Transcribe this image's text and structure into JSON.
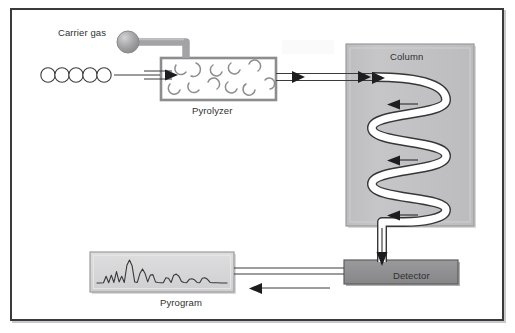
{
  "diagram": {
    "labels": {
      "carrier_gas": "Carrier gas",
      "pyrolyzer": "Pyrolyzer",
      "column": "Column",
      "detector": "Detector",
      "pyrogram": "Pyrogram"
    },
    "colors": {
      "frame_border": "#3a3a3c",
      "background": "#ffffff",
      "column_fill": "#c2c2c4",
      "column_border": "#8e8e90",
      "detector_fill": "#8f8f91",
      "detector_border": "#5c5c5e",
      "pyrolyzer_border": "#8a8a8c",
      "pyrogram_fill": "#d6d6d8",
      "pyrogram_border": "#9a9a9c",
      "tube_fill": "#ffffff",
      "tube_stroke": "#3a3a3c",
      "gas_sphere": "#9e9ea0",
      "line": "#3a3a3c"
    },
    "components": {
      "carrier_gas_sphere": {
        "cx": 128,
        "cy": 42,
        "r": 11
      },
      "sample_chain": {
        "description": "polymer chain of five linked circles",
        "count": 5,
        "radius": 7,
        "cy": 75,
        "start_cx": 48,
        "spacing": 14
      },
      "pyrolyzer_box": {
        "x": 161,
        "y": 58,
        "w": 115,
        "h": 42
      },
      "pyrolyzer_fragments": {
        "description": "broken polymer arc fragments inside pyrolyzer",
        "count": 11
      },
      "column_box": {
        "x": 346,
        "y": 44,
        "w": 128,
        "h": 182
      },
      "column_coil_turns": 4,
      "detector_box": {
        "x": 344,
        "y": 260,
        "w": 114,
        "h": 24
      },
      "pyrogram_box": {
        "x": 90,
        "y": 252,
        "w": 144,
        "h": 40
      }
    },
    "flow": [
      {
        "from": "sample_chain",
        "to": "pyrolyzer",
        "direction": "right"
      },
      {
        "from": "carrier_gas",
        "to": "pyrolyzer",
        "direction": "down"
      },
      {
        "from": "pyrolyzer",
        "to": "column",
        "direction": "right"
      },
      {
        "from": "column",
        "to": "detector",
        "direction": "down"
      },
      {
        "from": "detector",
        "to": "pyrogram",
        "direction": "left"
      }
    ]
  },
  "chart_data": {
    "type": "line",
    "title": "Pyrogram",
    "xlabel": "",
    "ylabel": "",
    "grid": false,
    "legend_position": "none",
    "x": [
      0,
      2,
      5,
      7,
      9,
      11,
      13,
      15,
      17,
      19,
      21,
      23,
      25,
      27,
      29,
      31,
      33,
      35,
      37,
      39,
      41,
      43,
      45,
      47,
      49,
      51,
      53,
      55,
      57,
      59,
      61,
      63,
      65,
      67,
      69,
      71,
      73,
      75,
      77,
      79,
      81,
      83,
      85,
      87,
      89,
      92,
      96,
      100
    ],
    "values": [
      4,
      4,
      5,
      30,
      5,
      34,
      6,
      48,
      8,
      30,
      6,
      72,
      92,
      70,
      8,
      6,
      40,
      58,
      40,
      8,
      34,
      36,
      8,
      6,
      5,
      5,
      24,
      22,
      6,
      34,
      38,
      30,
      10,
      6,
      5,
      18,
      20,
      16,
      6,
      5,
      22,
      24,
      18,
      6,
      5,
      5,
      4,
      4
    ],
    "ylim": [
      0,
      100
    ],
    "xlim": [
      0,
      100
    ],
    "peaks": [
      {
        "x": 7,
        "height": 30
      },
      {
        "x": 11,
        "height": 34
      },
      {
        "x": 15,
        "height": 48
      },
      {
        "x": 19,
        "height": 30
      },
      {
        "x": 25,
        "height": 92
      },
      {
        "x": 33,
        "height": 58
      },
      {
        "x": 42,
        "height": 36
      },
      {
        "x": 54,
        "height": 24
      },
      {
        "x": 61,
        "height": 38
      },
      {
        "x": 73,
        "height": 20
      },
      {
        "x": 83,
        "height": 24
      }
    ]
  }
}
